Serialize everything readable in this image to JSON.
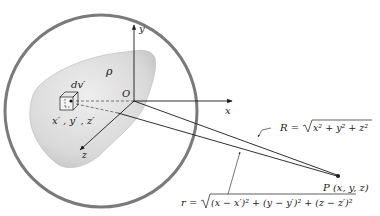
{
  "diagram": {
    "type": "potential-of-charge-distribution",
    "labels": {
      "density": "ρ",
      "volume_element": "dv′",
      "source_coords": "x′ , y′ , z′",
      "origin": "O",
      "x_axis": "x",
      "y_axis": "y",
      "z_axis": "z",
      "field_point": "P (x, y, z)",
      "R_lhs": "R =",
      "R_radicand": "x² + y² + z²",
      "r_lhs": "r =",
      "r_radicand": "(x − x′)² + (y − y′)² + (z − z′)²"
    },
    "colors": {
      "sphere_outline": "#7a7a7a",
      "body_fill": "#dcdcdc",
      "body_shade": "#c4c4c4",
      "line": "#1a1a1a",
      "dashed": "#555555"
    }
  }
}
